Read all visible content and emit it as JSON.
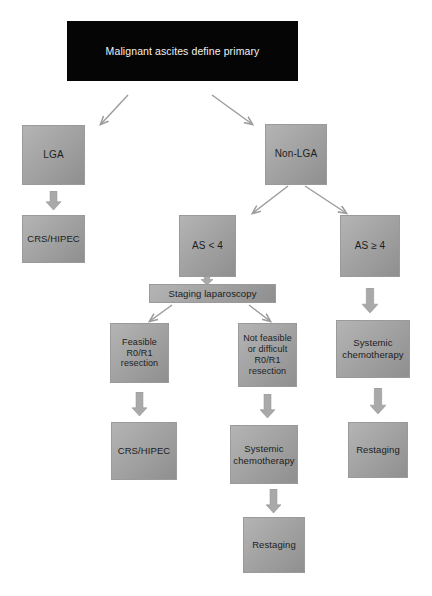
{
  "diagram": {
    "title_node": {
      "label": "Malignant ascites define primary",
      "x": 67,
      "y": 21,
      "w": 231,
      "h": 60,
      "font": 10.5,
      "bg": "#050505",
      "color": "#f2f2f2"
    },
    "nodes": [
      {
        "id": "lga",
        "label": "LGA",
        "x": 22,
        "y": 125,
        "w": 63,
        "h": 60,
        "font": 10
      },
      {
        "id": "nonlga",
        "label": "Non-LGA",
        "x": 265,
        "y": 124,
        "w": 62,
        "h": 61,
        "font": 10
      },
      {
        "id": "crs_left",
        "label": "CRS/HIPEC",
        "x": 22,
        "y": 215,
        "w": 63,
        "h": 48,
        "font": 9.5
      },
      {
        "id": "as_lt4",
        "label": "AS < 4",
        "x": 179,
        "y": 215,
        "w": 57,
        "h": 62,
        "font": 10
      },
      {
        "id": "as_ge4",
        "label": "AS ≥ 4",
        "x": 340,
        "y": 215,
        "w": 60,
        "h": 62,
        "font": 10
      },
      {
        "id": "staging",
        "label": "Staging laparoscopy",
        "x": 149,
        "y": 284,
        "w": 127,
        "h": 19,
        "font": 9.5
      },
      {
        "id": "feasible",
        "label": "Feasible\nR0/R1\nresection",
        "x": 110,
        "y": 323,
        "w": 59,
        "h": 60,
        "font": 9
      },
      {
        "id": "not_feasible",
        "label": "Not feasible\nor difficult\nR0/R1\nresection",
        "x": 238,
        "y": 323,
        "w": 59,
        "h": 64,
        "font": 9
      },
      {
        "id": "chemo_right",
        "label": "Systemic\nchemotherapy",
        "x": 336,
        "y": 320,
        "w": 74,
        "h": 58,
        "font": 9.5
      },
      {
        "id": "crs_mid",
        "label": "CRS/HIPEC",
        "x": 111,
        "y": 422,
        "w": 66,
        "h": 58,
        "font": 9.5
      },
      {
        "id": "chemo_mid",
        "label": "Systemic\nchemotherapy",
        "x": 230,
        "y": 425,
        "w": 68,
        "h": 59,
        "font": 9.5
      },
      {
        "id": "restaging_right",
        "label": "Restaging",
        "x": 348,
        "y": 422,
        "w": 60,
        "h": 56,
        "font": 9.5
      },
      {
        "id": "restaging_mid",
        "label": "Restaging",
        "x": 243,
        "y": 517,
        "w": 62,
        "h": 56,
        "font": 9.5
      }
    ],
    "line_arrows": [
      {
        "id": "title-to-lga",
        "x1": 128,
        "y1": 95,
        "x2": 101,
        "y2": 124
      },
      {
        "id": "title-to-nonlga",
        "x1": 212,
        "y1": 95,
        "x2": 252,
        "y2": 124
      },
      {
        "id": "nonlga-to-aslt4",
        "x1": 288,
        "y1": 186,
        "x2": 253,
        "y2": 213
      },
      {
        "id": "nonlga-to-asge4",
        "x1": 305,
        "y1": 186,
        "x2": 346,
        "y2": 213
      },
      {
        "id": "staging-to-feasible",
        "x1": 172,
        "y1": 305,
        "x2": 150,
        "y2": 321
      },
      {
        "id": "staging-to-notfeas",
        "x1": 249,
        "y1": 305,
        "x2": 270,
        "y2": 321
      }
    ],
    "block_arrows": [
      {
        "id": "lga-to-crs",
        "cx": 53,
        "top": 191,
        "h": 19,
        "w": 15
      },
      {
        "id": "aslt4-to-staging",
        "cx": 207,
        "top": 275,
        "h": 10,
        "w": 12
      },
      {
        "id": "asge4-to-chemo",
        "cx": 370,
        "top": 288,
        "h": 25,
        "w": 16
      },
      {
        "id": "feasible-to-crs",
        "cx": 139,
        "top": 392,
        "h": 24,
        "w": 15
      },
      {
        "id": "notfeasible-to-chemo",
        "cx": 267,
        "top": 394,
        "h": 24,
        "w": 15
      },
      {
        "id": "chemo-right-to-restaging",
        "cx": 378,
        "top": 388,
        "h": 26,
        "w": 16
      },
      {
        "id": "chemo-mid-to-restaging",
        "cx": 273,
        "top": 489,
        "h": 24,
        "w": 15
      }
    ],
    "colors": {
      "box_light": "#b4b4b4",
      "box_dark": "#8f8f8f",
      "title_bg": "#050505",
      "title_text": "#f2f2f2",
      "arrow": "#a9a9a9",
      "line": "#9b9b9b",
      "text": "#1c1c1c"
    }
  }
}
